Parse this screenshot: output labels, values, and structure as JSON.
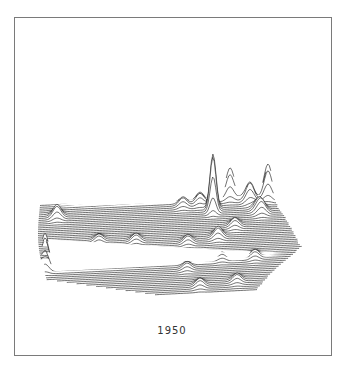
{
  "figure": {
    "type": "3d-ridge-line-population-density-map",
    "region": "Contiguous United States",
    "year_label": "1950",
    "line_color": "#111111",
    "background": "#ffffff",
    "frame_color": "#7a7a7a"
  },
  "map": {
    "rows": 52,
    "outline": {
      "top_left": [
        40,
        208
      ],
      "top_right": [
        270,
        196
      ],
      "bottom_left": [
        55,
        292
      ],
      "bottom_right": [
        305,
        282
      ],
      "south_tip": [
        190,
        300
      ]
    },
    "peaks": [
      {
        "name": "New York",
        "x": 272,
        "y_base": 182,
        "height": 142
      },
      {
        "name": "New York secondary",
        "x": 274,
        "y_base": 190,
        "height": 70
      },
      {
        "name": "Boston",
        "x": 278,
        "y_base": 180,
        "height": 38
      },
      {
        "name": "Chicago",
        "x": 213,
        "y_base": 212,
        "height": 56
      },
      {
        "name": "Detroit",
        "x": 230,
        "y_base": 200,
        "height": 28
      },
      {
        "name": "Philadelphia",
        "x": 268,
        "y_base": 202,
        "height": 32
      },
      {
        "name": "Pittsburgh",
        "x": 250,
        "y_base": 205,
        "height": 18
      },
      {
        "name": "Cleveland",
        "x": 242,
        "y_base": 198,
        "height": 16
      },
      {
        "name": "Los Angeles",
        "x": 62,
        "y_base": 290,
        "height": 58
      },
      {
        "name": "San Francisco",
        "x": 45,
        "y_base": 262,
        "height": 34
      },
      {
        "name": "Seattle",
        "x": 57,
        "y_base": 212,
        "height": 12
      },
      {
        "name": "St. Louis",
        "x": 218,
        "y_base": 240,
        "height": 10
      },
      {
        "name": "Minneapolis",
        "x": 183,
        "y_base": 207,
        "height": 8
      },
      {
        "name": "Kansas City",
        "x": 188,
        "y_base": 244,
        "height": 7
      },
      {
        "name": "Denver",
        "x": 136,
        "y_base": 240,
        "height": 7
      },
      {
        "name": "Salt Lake City",
        "x": 99,
        "y_base": 238,
        "height": 6
      },
      {
        "name": "New Orleans",
        "x": 237,
        "y_base": 285,
        "height": 7
      },
      {
        "name": "Houston",
        "x": 200,
        "y_base": 288,
        "height": 7
      },
      {
        "name": "Dallas",
        "x": 187,
        "y_base": 270,
        "height": 6
      },
      {
        "name": "Atlanta",
        "x": 255,
        "y_base": 262,
        "height": 7
      },
      {
        "name": "Washington",
        "x": 262,
        "y_base": 218,
        "height": 10
      },
      {
        "name": "Baltimore",
        "x": 258,
        "y_base": 214,
        "height": 9
      },
      {
        "name": "Cincinnati",
        "x": 235,
        "y_base": 230,
        "height": 8
      },
      {
        "name": "Miami",
        "x": 300,
        "y_base": 282,
        "height": 6
      },
      {
        "name": "Memphis",
        "x": 222,
        "y_base": 262,
        "height": 6
      },
      {
        "name": "Milwaukee",
        "x": 200,
        "y_base": 205,
        "height": 10
      }
    ]
  }
}
